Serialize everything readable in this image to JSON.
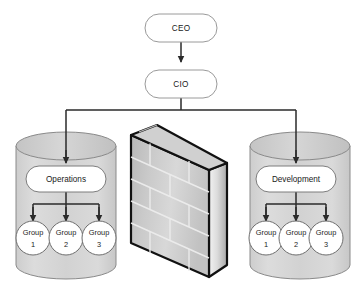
{
  "diagram": {
    "type": "organizational-network-diagram",
    "background_color": "#ffffff",
    "executives": [
      {
        "id": "ceo",
        "label": "CEO"
      },
      {
        "id": "cio",
        "label": "CIO"
      }
    ],
    "zones": [
      {
        "id": "operations-zone",
        "container_shape": "cylinder",
        "department": {
          "label": "Operations"
        },
        "groups": [
          {
            "line1": "Group",
            "line2": "1"
          },
          {
            "line1": "Group",
            "line2": "2"
          },
          {
            "line1": "Group",
            "line2": "3"
          }
        ]
      },
      {
        "id": "development-zone",
        "container_shape": "cylinder",
        "department": {
          "label": "Development"
        },
        "groups": [
          {
            "line1": "Group",
            "line2": "1"
          },
          {
            "line1": "Group",
            "line2": "2"
          },
          {
            "line1": "Group",
            "line2": "3"
          }
        ]
      }
    ],
    "firewall": {
      "id": "firewall",
      "shape": "3d-brick-wall",
      "label": ""
    },
    "colors": {
      "cylinder_fill": "#d4d4d4",
      "cylinder_top": "#c9c9c9",
      "cylinder_stroke": "#8a8a8a",
      "node_fill": "#ffffff",
      "node_stroke": "#9a9a9a",
      "connector": "#3a3a3a",
      "brick_face": "#c6c6c6",
      "brick_mortar": "#e8e8e8",
      "wall_outline": "#111111",
      "text": "#1a1a1a"
    }
  }
}
